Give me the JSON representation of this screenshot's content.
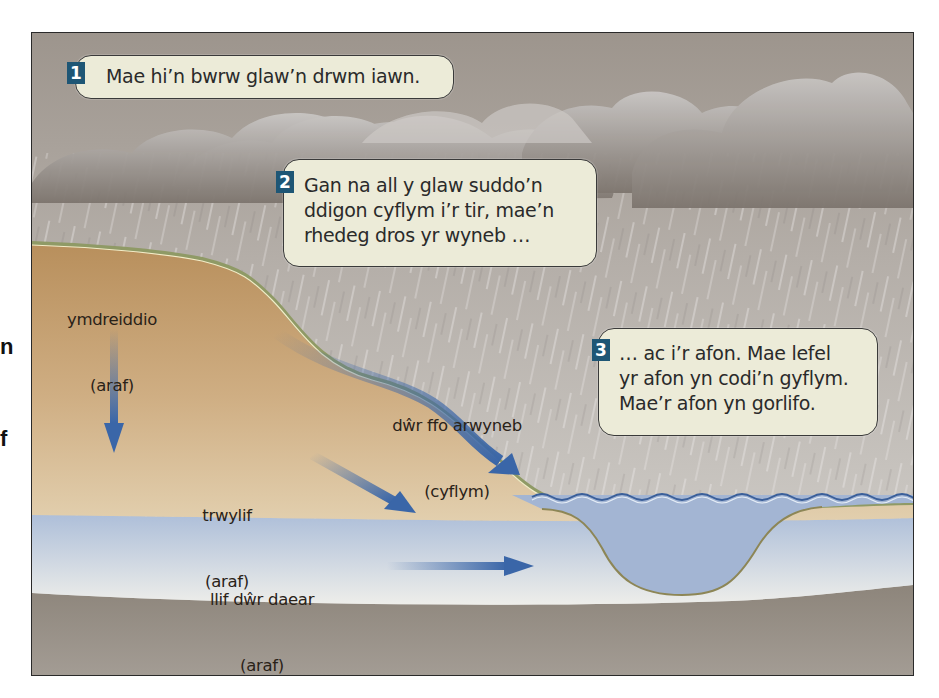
{
  "edge_fragments": [
    "n",
    "f"
  ],
  "steps": [
    {
      "number": "1",
      "text": "Mae hi’n bwrw glaw’n drwm iawn."
    },
    {
      "number": "2",
      "text": "Gan na all y glaw suddo’n\nddigon cyflym i’r tir, mae’n\nrhedeg dros yr wyneb …"
    },
    {
      "number": "3",
      "text": "… ac i’r afon. Mae lefel\nyr afon yn codi’n gyflym.\nMae’r afon yn gorlifo."
    }
  ],
  "flows": {
    "infiltration": {
      "name": "ymdreiddio",
      "speed": "(araf)"
    },
    "surface_runoff": {
      "name": "dŵr ffo arwyneb",
      "speed": "(cyflym)"
    },
    "throughflow": {
      "name": "trwylif",
      "speed": "(araf)"
    },
    "groundwater_flow": {
      "name": "llif dŵr daear",
      "speed": "(araf)"
    }
  },
  "colors": {
    "badge": "#1e5675",
    "bubble_fill": "#ecebd8",
    "soil": "#c9a577",
    "groundwater": "#b9c7dc",
    "bedrock": "#8f887f",
    "arrow": "#3a66a8",
    "river": "#a3b5d3"
  }
}
